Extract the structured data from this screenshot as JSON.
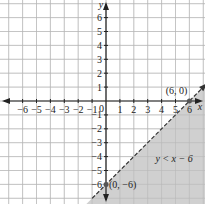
{
  "chart_data": {
    "type": "line",
    "title": "",
    "xlabel": "x",
    "ylabel": "y",
    "xlim": [
      -7,
      7
    ],
    "ylim": [
      -7,
      7
    ],
    "grid": true,
    "x_ticks": [
      "-6",
      "-5",
      "-4",
      "-3",
      "-2",
      "-1",
      "1",
      "2",
      "3",
      "4",
      "5",
      "6"
    ],
    "y_ticks": [
      "6",
      "5",
      "4",
      "3",
      "2",
      "1",
      "-1",
      "-2",
      "-3",
      "-4",
      "-5",
      "-6"
    ],
    "origin_label": "0",
    "boundary_line": {
      "equation": "y = x - 6",
      "style": "dashed",
      "slope": 1,
      "intercept": -6
    },
    "shaded_region": "below the line",
    "points": [
      {
        "x": 6,
        "y": 0,
        "label": "(6, 0)"
      },
      {
        "x": 0,
        "y": -6,
        "label": "(0, -6)"
      }
    ],
    "annotation": "y < x − 6",
    "colors": {
      "shade": "#c8c8c8",
      "grid": "#bfbfbf",
      "axis": "#222222"
    }
  },
  "labels": {
    "x_axis": "x",
    "y_axis": "y",
    "origin": "0",
    "point_a": "(6, 0)",
    "point_b": "(0, −6)",
    "inequality": "y < x − 6"
  }
}
